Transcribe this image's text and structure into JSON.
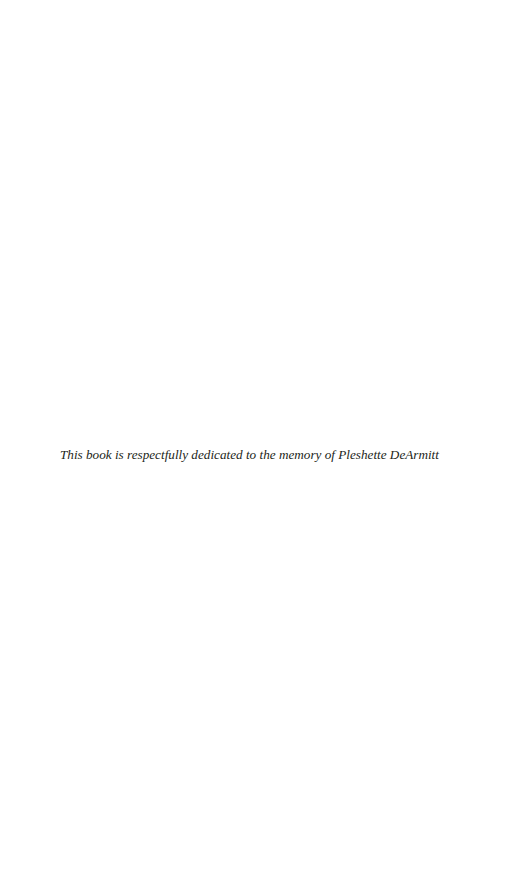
{
  "page": {
    "dedication": "This book is respectfully dedicated to the memory of Pleshette DeArmitt"
  }
}
